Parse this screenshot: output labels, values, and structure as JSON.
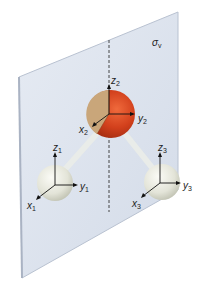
{
  "figure": {
    "plane_label": "σ",
    "plane_label_sub": "v",
    "colors": {
      "plane": "#dde4ef",
      "plane_edge": "#b9c2d1",
      "oxygen": "#d2401c",
      "oxygen_cut": "#c9a67a",
      "hydrogen": "#e6e6da",
      "bond": "#e9ece9",
      "axis": "#111111"
    },
    "atoms": [
      {
        "name": "H1",
        "axes": {
          "x": "x",
          "x_sub": "1",
          "y": "y",
          "y_sub": "1",
          "z": "z",
          "z_sub": "1"
        }
      },
      {
        "name": "O2",
        "axes": {
          "x": "x",
          "x_sub": "2",
          "y": "y",
          "y_sub": "2",
          "z": "z",
          "z_sub": "2"
        }
      },
      {
        "name": "H3",
        "axes": {
          "x": "x",
          "x_sub": "3",
          "y": "y",
          "y_sub": "3",
          "z": "z",
          "z_sub": "3"
        }
      }
    ]
  }
}
